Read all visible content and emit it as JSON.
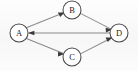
{
  "diagram": {
    "type": "directed-graph",
    "canvas": {
      "width": 138,
      "height": 71
    },
    "colors": {
      "background": "#fbfbfb",
      "edge": "#8a8a8a",
      "arrowhead": "#3a3a3a",
      "node_stroke": "#4a4a4a",
      "node_fill": "#ffffff",
      "label": "#1e1e1e"
    },
    "nodes": [
      {
        "id": "A",
        "label": "A",
        "cx": 19,
        "cy": 33,
        "r": 9
      },
      {
        "id": "B",
        "label": "B",
        "cx": 72,
        "cy": 10,
        "r": 9
      },
      {
        "id": "C",
        "label": "C",
        "cx": 72,
        "cy": 57,
        "r": 9
      },
      {
        "id": "D",
        "label": "D",
        "cx": 119,
        "cy": 33,
        "r": 9
      }
    ],
    "edges": [
      {
        "id": "A-B",
        "from": "A",
        "to": "B",
        "directed": true
      },
      {
        "id": "B-D",
        "from": "B",
        "to": "D",
        "directed": true
      },
      {
        "id": "A-C",
        "from": "A",
        "to": "C",
        "directed": true
      },
      {
        "id": "C-D",
        "from": "C",
        "to": "D",
        "directed": true
      },
      {
        "id": "D-A",
        "from": "D",
        "to": "A",
        "directed": true
      }
    ]
  }
}
